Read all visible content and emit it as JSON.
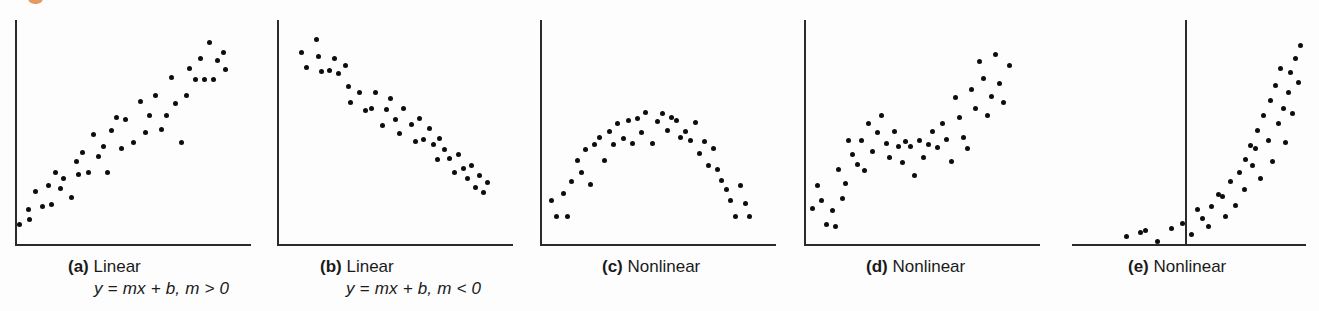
{
  "figure": {
    "background_color": "#fdfdfd",
    "axis_color": "#2b2b2b",
    "dot_color": "#0d0d0d",
    "corner_mark_color": "#e08845",
    "width": 1319,
    "height": 311
  },
  "panels": [
    {
      "id": "a",
      "tag": "(a)",
      "title": "Linear",
      "equation": "y = mx + b, m > 0",
      "caption_left": 68,
      "caption_top": 256,
      "plot": {
        "left": 15,
        "top": 20,
        "width": 236,
        "height": 224
      },
      "y_axis": {
        "x": 0,
        "y_top": 0,
        "height": 224
      },
      "x_axis": {
        "x": 0,
        "y": 224,
        "width": 236
      }
    },
    {
      "id": "b",
      "tag": "(b)",
      "title": "Linear",
      "equation": "y = mx + b, m < 0",
      "caption_left": 320,
      "caption_top": 256,
      "plot": {
        "left": 277,
        "top": 20,
        "width": 236,
        "height": 224
      },
      "y_axis": {
        "x": 0,
        "y_top": 0,
        "height": 224
      },
      "x_axis": {
        "x": 0,
        "y": 224,
        "width": 236
      }
    },
    {
      "id": "c",
      "tag": "(c)",
      "title": "Nonlinear",
      "equation": "",
      "caption_left": 602,
      "caption_top": 256,
      "plot": {
        "left": 540,
        "top": 20,
        "width": 236,
        "height": 224
      },
      "y_axis": {
        "x": 0,
        "y_top": 0,
        "height": 224
      },
      "x_axis": {
        "x": 0,
        "y": 224,
        "width": 236
      }
    },
    {
      "id": "d",
      "tag": "(d)",
      "title": "Nonlinear",
      "equation": "",
      "caption_left": 866,
      "caption_top": 256,
      "plot": {
        "left": 804,
        "top": 20,
        "width": 236,
        "height": 224
      },
      "y_axis": {
        "x": 0,
        "y_top": 0,
        "height": 224
      },
      "x_axis": {
        "x": 0,
        "y": 224,
        "width": 236
      }
    },
    {
      "id": "e",
      "tag": "(e)",
      "title": "Nonlinear",
      "equation": "",
      "caption_left": 1128,
      "caption_top": 256,
      "plot": {
        "left": 1072,
        "top": 20,
        "width": 234,
        "height": 224
      },
      "y_axis": {
        "x": 113,
        "y_top": 0,
        "height": 224
      },
      "x_axis": {
        "x": 0,
        "y": 224,
        "width": 234
      }
    }
  ],
  "chart_data": {
    "type": "scatter",
    "title": "",
    "xlabel": "",
    "ylabel": "",
    "grid": false,
    "legend": "none",
    "note": "Five small scatterplots illustrating linear and nonlinear relationships. Coordinates are in plot-local pixels (origin at top-left of each plot box, 236x224).",
    "panels": [
      {
        "id": "a",
        "label": "(a) Linear  y = mx + b, m > 0",
        "relationship": "linear-positive",
        "points": [
          [
            4,
            204
          ],
          [
            14,
            199
          ],
          [
            13,
            189
          ],
          [
            20,
            171
          ],
          [
            27,
            186
          ],
          [
            33,
            165
          ],
          [
            36,
            184
          ],
          [
            40,
            152
          ],
          [
            45,
            168
          ],
          [
            48,
            158
          ],
          [
            56,
            177
          ],
          [
            61,
            141
          ],
          [
            63,
            154
          ],
          [
            67,
            132
          ],
          [
            73,
            152
          ],
          [
            78,
            114
          ],
          [
            83,
            136
          ],
          [
            88,
            126
          ],
          [
            92,
            152
          ],
          [
            96,
            110
          ],
          [
            101,
            97
          ],
          [
            106,
            128
          ],
          [
            110,
            99
          ],
          [
            118,
            122
          ],
          [
            125,
            81
          ],
          [
            130,
            112
          ],
          [
            134,
            95
          ],
          [
            140,
            75
          ],
          [
            146,
            109
          ],
          [
            151,
            95
          ],
          [
            156,
            57
          ],
          [
            160,
            83
          ],
          [
            166,
            122
          ],
          [
            171,
            75
          ],
          [
            174,
            48
          ],
          [
            180,
            59
          ],
          [
            185,
            38
          ],
          [
            189,
            59
          ],
          [
            194,
            22
          ],
          [
            198,
            59
          ],
          [
            202,
            40
          ],
          [
            208,
            32
          ],
          [
            210,
            49
          ]
        ]
      },
      {
        "id": "b",
        "label": "(b) Linear  y = mx + b, m < 0",
        "relationship": "linear-negative",
        "points": [
          [
            24,
            32
          ],
          [
            29,
            47
          ],
          [
            39,
            19
          ],
          [
            41,
            36
          ],
          [
            44,
            51
          ],
          [
            52,
            50
          ],
          [
            57,
            38
          ],
          [
            61,
            53
          ],
          [
            68,
            45
          ],
          [
            71,
            66
          ],
          [
            73,
            82
          ],
          [
            82,
            72
          ],
          [
            88,
            90
          ],
          [
            94,
            88
          ],
          [
            98,
            72
          ],
          [
            105,
            105
          ],
          [
            109,
            89
          ],
          [
            113,
            78
          ],
          [
            118,
            99
          ],
          [
            122,
            113
          ],
          [
            126,
            88
          ],
          [
            134,
            104
          ],
          [
            138,
            121
          ],
          [
            142,
            98
          ],
          [
            146,
            119
          ],
          [
            152,
            108
          ],
          [
            156,
            124
          ],
          [
            160,
            139
          ],
          [
            162,
            118
          ],
          [
            167,
            129
          ],
          [
            172,
            138
          ],
          [
            177,
            152
          ],
          [
            181,
            134
          ],
          [
            186,
            148
          ],
          [
            190,
            158
          ],
          [
            194,
            145
          ],
          [
            198,
            167
          ],
          [
            202,
            155
          ],
          [
            206,
            172
          ],
          [
            210,
            162
          ]
        ]
      },
      {
        "id": "c",
        "label": "(c) Nonlinear",
        "relationship": "nonlinear-quadratic-concave-down",
        "points": [
          [
            11,
            180
          ],
          [
            16,
            196
          ],
          [
            23,
            173
          ],
          [
            27,
            196
          ],
          [
            31,
            161
          ],
          [
            37,
            140
          ],
          [
            41,
            152
          ],
          [
            45,
            129
          ],
          [
            50,
            164
          ],
          [
            54,
            124
          ],
          [
            59,
            117
          ],
          [
            64,
            140
          ],
          [
            69,
            111
          ],
          [
            73,
            124
          ],
          [
            77,
            103
          ],
          [
            83,
            118
          ],
          [
            88,
            100
          ],
          [
            92,
            123
          ],
          [
            97,
            98
          ],
          [
            101,
            112
          ],
          [
            105,
            92
          ],
          [
            112,
            123
          ],
          [
            117,
            101
          ],
          [
            122,
            93
          ],
          [
            127,
            110
          ],
          [
            131,
            97
          ],
          [
            136,
            100
          ],
          [
            140,
            117
          ],
          [
            145,
            111
          ],
          [
            150,
            120
          ],
          [
            155,
            102
          ],
          [
            159,
            133
          ],
          [
            164,
            121
          ],
          [
            168,
            145
          ],
          [
            173,
            128
          ],
          [
            177,
            149
          ],
          [
            181,
            160
          ],
          [
            186,
            169
          ],
          [
            190,
            180
          ],
          [
            195,
            196
          ],
          [
            200,
            165
          ],
          [
            205,
            183
          ],
          [
            209,
            196
          ]
        ]
      },
      {
        "id": "d",
        "label": "(d) Nonlinear",
        "relationship": "nonlinear-wavy-increasing",
        "points": [
          [
            8,
            188
          ],
          [
            13,
            165
          ],
          [
            17,
            180
          ],
          [
            22,
            204
          ],
          [
            28,
            190
          ],
          [
            31,
            206
          ],
          [
            34,
            149
          ],
          [
            38,
            178
          ],
          [
            41,
            163
          ],
          [
            44,
            120
          ],
          [
            48,
            134
          ],
          [
            53,
            144
          ],
          [
            57,
            120
          ],
          [
            60,
            150
          ],
          [
            64,
            103
          ],
          [
            68,
            131
          ],
          [
            73,
            112
          ],
          [
            77,
            95
          ],
          [
            82,
            123
          ],
          [
            85,
            137
          ],
          [
            90,
            111
          ],
          [
            94,
            126
          ],
          [
            98,
            142
          ],
          [
            101,
            121
          ],
          [
            106,
            126
          ],
          [
            110,
            155
          ],
          [
            115,
            120
          ],
          [
            119,
            137
          ],
          [
            124,
            124
          ],
          [
            128,
            111
          ],
          [
            133,
            127
          ],
          [
            138,
            103
          ],
          [
            142,
            119
          ],
          [
            147,
            141
          ],
          [
            151,
            77
          ],
          [
            155,
            97
          ],
          [
            159,
            117
          ],
          [
            163,
            128
          ],
          [
            167,
            69
          ],
          [
            171,
            88
          ],
          [
            175,
            41
          ],
          [
            179,
            58
          ],
          [
            183,
            95
          ],
          [
            187,
            76
          ],
          [
            191,
            34
          ],
          [
            195,
            63
          ],
          [
            199,
            82
          ],
          [
            205,
            45
          ]
        ]
      },
      {
        "id": "e",
        "label": "(e) Nonlinear",
        "relationship": "nonlinear-exponential",
        "points": [
          [
            54,
            216
          ],
          [
            68,
            212
          ],
          [
            73,
            210
          ],
          [
            85,
            221
          ],
          [
            99,
            208
          ],
          [
            110,
            203
          ],
          [
            119,
            214
          ],
          [
            130,
            198
          ],
          [
            125,
            189
          ],
          [
            139,
            186
          ],
          [
            136,
            206
          ],
          [
            146,
            174
          ],
          [
            153,
            196
          ],
          [
            158,
            161
          ],
          [
            150,
            176
          ],
          [
            163,
            185
          ],
          [
            167,
            152
          ],
          [
            173,
            139
          ],
          [
            172,
            169
          ],
          [
            178,
            125
          ],
          [
            180,
            145
          ],
          [
            185,
            110
          ],
          [
            188,
            158
          ],
          [
            191,
            95
          ],
          [
            183,
            128
          ],
          [
            196,
            120
          ],
          [
            198,
            80
          ],
          [
            200,
            141
          ],
          [
            203,
            65
          ],
          [
            206,
            103
          ],
          [
            208,
            48
          ],
          [
            211,
            88
          ],
          [
            213,
            122
          ],
          [
            216,
            72
          ],
          [
            218,
            52
          ],
          [
            220,
            93
          ],
          [
            223,
            38
          ],
          [
            226,
            62
          ],
          [
            228,
            25
          ]
        ]
      }
    ]
  }
}
